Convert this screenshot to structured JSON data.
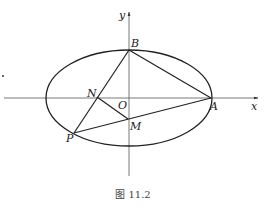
{
  "figure": {
    "caption": "图 11.2",
    "colors": {
      "stroke": "#222222",
      "axis": "#333333",
      "background": "#ffffff"
    },
    "axes": {
      "x_label": "x",
      "y_label": "y",
      "origin_label": "O"
    },
    "ellipse": {
      "cx": 129,
      "cy": 98,
      "rx": 83,
      "ry": 48
    },
    "points": {
      "A": {
        "label": "A",
        "x": 211,
        "y": 98
      },
      "B": {
        "label": "B",
        "x": 129,
        "y": 50
      },
      "N": {
        "label": "N",
        "x": 97,
        "y": 97
      },
      "M": {
        "label": "M",
        "x": 128,
        "y": 119
      },
      "P": {
        "label": "P",
        "x": 74,
        "y": 133
      }
    },
    "segments": [
      "BA",
      "BP",
      "PA",
      "NM"
    ]
  }
}
